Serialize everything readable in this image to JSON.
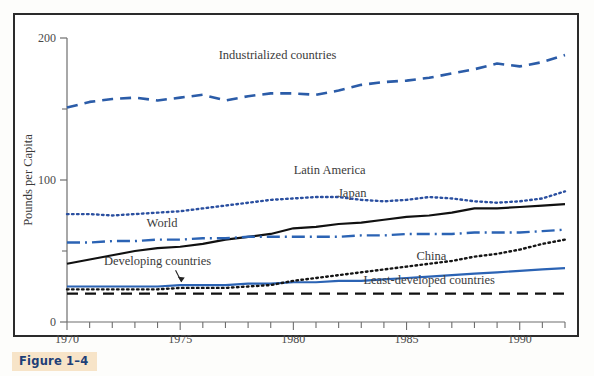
{
  "figure": {
    "caption": "Figure 1–4",
    "caption_bg": "#f7e4c8",
    "caption_color": "#1d3f77",
    "frame_color": "#2b2b2b"
  },
  "chart_data": {
    "type": "line",
    "title": "",
    "subtitle": "",
    "xlabel": "",
    "ylabel": "Pounds per Capita",
    "xlim": [
      1970,
      1992
    ],
    "ylim": [
      0,
      200
    ],
    "grid": false,
    "legend_position": "inline-annotations",
    "x_major_ticks": [
      1970,
      1975,
      1980,
      1985,
      1990
    ],
    "x_tick_labels": [
      "1970",
      "1975",
      "1980",
      "1985",
      "1990"
    ],
    "x_minor_tick_step": 1,
    "y_major_ticks": [
      0,
      100,
      200
    ],
    "y_tick_labels": [
      "0",
      "100",
      "200"
    ],
    "y_minor_ticks": [
      50,
      150
    ],
    "x": [
      1970,
      1971,
      1972,
      1973,
      1974,
      1975,
      1976,
      1977,
      1978,
      1979,
      1980,
      1981,
      1982,
      1983,
      1984,
      1985,
      1986,
      1987,
      1988,
      1989,
      1990,
      1991,
      1992
    ],
    "series": [
      {
        "name": "Industrialized countries",
        "color": "#2b5ca8",
        "style": "dashed",
        "width": 2.6,
        "label": "Industrialized countries",
        "label_x": 1979.3,
        "label_y": 185,
        "values": [
          151,
          155,
          157,
          158,
          156,
          158,
          160,
          156,
          159,
          161,
          161,
          160,
          163,
          167,
          169,
          170,
          172,
          175,
          178,
          182,
          180,
          183,
          188
        ]
      },
      {
        "name": "Latin America",
        "color": "#2a4fa0",
        "style": "dotted",
        "width": 2.4,
        "label": "Latin America",
        "label_x": 1981.6,
        "label_y": 104,
        "values": [
          76,
          76,
          75,
          76,
          77,
          78,
          80,
          82,
          84,
          86,
          87,
          88,
          88,
          86,
          85,
          86,
          88,
          87,
          85,
          84,
          85,
          87,
          92
        ]
      },
      {
        "name": "Japan",
        "color": "#111111",
        "style": "solid",
        "width": 2.2,
        "label": "Japan",
        "label_x": 1982.6,
        "label_y": 88,
        "values": [
          41,
          44,
          47,
          50,
          52,
          53,
          55,
          58,
          60,
          62,
          66,
          67,
          69,
          70,
          72,
          74,
          75,
          77,
          80,
          80,
          81,
          82,
          83
        ]
      },
      {
        "name": "World",
        "color": "#2b63b4",
        "style": "dash-dot",
        "width": 2.4,
        "label": "World",
        "label_x": 1974.2,
        "label_y": 67,
        "values": [
          56,
          56,
          57,
          57,
          58,
          58,
          59,
          59,
          60,
          60,
          60,
          60,
          60,
          61,
          61,
          62,
          62,
          62,
          63,
          63,
          63,
          64,
          65
        ]
      },
      {
        "name": "Developing countries",
        "color": "#2b63b4",
        "style": "solid",
        "width": 2.2,
        "label": "Developing countries",
        "label_x": 1974.0,
        "label_y": 40,
        "label_arrow": true,
        "values": [
          25,
          25,
          25,
          25,
          25,
          26,
          26,
          26,
          27,
          27,
          28,
          28,
          29,
          29,
          30,
          31,
          32,
          33,
          34,
          35,
          36,
          37,
          38
        ]
      },
      {
        "name": "China",
        "color": "#151515",
        "style": "dotted",
        "width": 2.4,
        "label": "China",
        "label_x": 1986.1,
        "label_y": 44,
        "values": [
          23,
          23,
          23,
          23,
          23,
          24,
          24,
          24,
          25,
          26,
          29,
          31,
          33,
          35,
          37,
          39,
          41,
          43,
          46,
          48,
          51,
          55,
          58
        ]
      },
      {
        "name": "Least-developed countries",
        "color": "#111111",
        "style": "dashed",
        "width": 2.4,
        "label": "Least-developed countries",
        "label_x": 1986.0,
        "label_y": 27,
        "values": [
          20,
          20,
          20,
          20,
          20,
          20,
          20,
          20,
          20,
          20,
          20,
          20,
          20,
          20,
          20,
          20,
          20,
          20,
          20,
          20,
          20,
          20,
          20
        ]
      }
    ]
  }
}
